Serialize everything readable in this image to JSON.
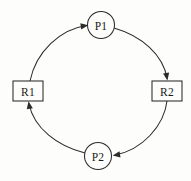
{
  "diagram": {
    "background_color": "#fdfdfb",
    "stroke_color": "#2b2b2b",
    "label_color": "#1a1a1a",
    "width": 191,
    "height": 181,
    "nodes": [
      {
        "id": "P1",
        "label": "P1",
        "shape": "circle",
        "role": "process",
        "cx": 101,
        "cy": 25,
        "r": 13.5
      },
      {
        "id": "R2",
        "label": "R2",
        "shape": "rectangle",
        "role": "resource",
        "x": 152,
        "y": 81,
        "w": 30,
        "h": 20
      },
      {
        "id": "P2",
        "label": "P2",
        "shape": "circle",
        "role": "process",
        "cx": 98,
        "cy": 156,
        "r": 13.5
      },
      {
        "id": "R1",
        "label": "R1",
        "shape": "rectangle",
        "role": "resource",
        "x": 13,
        "y": 81,
        "w": 30,
        "h": 20
      }
    ],
    "edges": [
      {
        "id": "R1-to-P1",
        "from": "R1",
        "to": "P1",
        "direction": "clockwise",
        "arrow_at": "P1",
        "path": "M 30 81 C 36 52 60 29 87 25.5",
        "arrow_tip": [
          87.5,
          25.2
        ],
        "arrow_angle": -9
      },
      {
        "id": "P1-to-R2",
        "from": "P1",
        "to": "R2",
        "direction": "clockwise",
        "arrow_at": "R2",
        "path": "M 114 28 C 142 36 163 55 167 78",
        "arrow_tip": [
          167.3,
          79.5
        ],
        "arrow_angle": 80
      },
      {
        "id": "R2-to-P2",
        "from": "R2",
        "to": "P2",
        "direction": "clockwise",
        "arrow_at": "P2",
        "path": "M 167 101 C 164 126 142 150 115 155",
        "arrow_tip": [
          113.5,
          155.4
        ],
        "arrow_angle": 171
      },
      {
        "id": "P2-to-R1",
        "from": "P2",
        "to": "R1",
        "direction": "clockwise",
        "arrow_at": "R1",
        "path": "M 85 153 C 57 146 34 128 29 104",
        "arrow_tip": [
          28.6,
          102
        ],
        "arrow_angle": -100
      }
    ]
  }
}
